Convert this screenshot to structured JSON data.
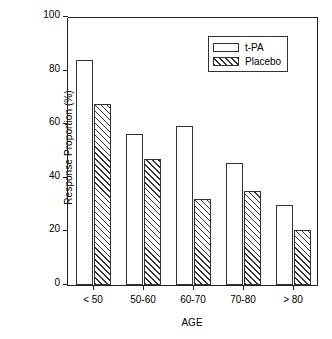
{
  "chart_data": {
    "type": "bar",
    "title": "",
    "subtitle": "",
    "xlabel": "AGE",
    "ylabel": "Response Proportion (%)",
    "categories": [
      "< 50",
      "50-60",
      "60-70",
      "70-80",
      "> 80"
    ],
    "series": [
      {
        "name": "t-PA",
        "values": [
          84,
          56.5,
          59.5,
          45.5,
          30
        ],
        "fill": "open"
      },
      {
        "name": "Placebo",
        "values": [
          67.5,
          47,
          32,
          35,
          20.5
        ],
        "fill": "hatched"
      }
    ],
    "ylim": [
      0,
      100
    ],
    "yticks": [
      0,
      20,
      40,
      60,
      80,
      100
    ],
    "ytick_labels": [
      "0",
      "20",
      "40",
      "60",
      "80",
      "100"
    ],
    "grid": false,
    "legend_position": "top-right",
    "legend_entries": [
      "t-PA",
      "Placebo"
    ],
    "axis_color": "#222222",
    "bar_edge_color": "#333333",
    "background": "#ffffff"
  }
}
